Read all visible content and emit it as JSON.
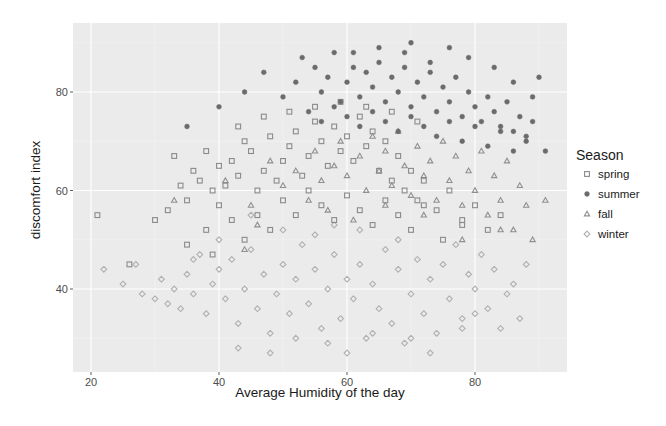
{
  "chart_data": {
    "type": "scatter",
    "title": "",
    "xlabel": "Average Humidity of the day",
    "ylabel": "discomfort index",
    "xlim": [
      17,
      94
    ],
    "ylim": [
      24,
      95
    ],
    "x_ticks": [
      20,
      40,
      60,
      80
    ],
    "y_ticks": [
      40,
      60,
      80
    ],
    "grid": true,
    "legend": {
      "title": "Season",
      "position": "right",
      "entries": [
        "spring",
        "summer",
        "fall",
        "winter"
      ]
    },
    "series": [
      {
        "name": "spring",
        "shape": "square-open",
        "color": "#8a8a8a",
        "points": [
          [
            21,
            55
          ],
          [
            26,
            45
          ],
          [
            30,
            54
          ],
          [
            32,
            56
          ],
          [
            33,
            67
          ],
          [
            34,
            61
          ],
          [
            35,
            58
          ],
          [
            36,
            64
          ],
          [
            37,
            62
          ],
          [
            38,
            68
          ],
          [
            39,
            60
          ],
          [
            40,
            65
          ],
          [
            41,
            61
          ],
          [
            42,
            66
          ],
          [
            43,
            63
          ],
          [
            44,
            70
          ],
          [
            45,
            68
          ],
          [
            46,
            60
          ],
          [
            47,
            64
          ],
          [
            48,
            71
          ],
          [
            49,
            62
          ],
          [
            50,
            66
          ],
          [
            51,
            69
          ],
          [
            52,
            72
          ],
          [
            53,
            63
          ],
          [
            54,
            67
          ],
          [
            55,
            74
          ],
          [
            56,
            70
          ],
          [
            57,
            65
          ],
          [
            58,
            73
          ],
          [
            59,
            68
          ],
          [
            60,
            71
          ],
          [
            61,
            66
          ],
          [
            62,
            75
          ],
          [
            63,
            69
          ],
          [
            64,
            72
          ],
          [
            65,
            64
          ],
          [
            66,
            70
          ],
          [
            67,
            62
          ],
          [
            68,
            67
          ],
          [
            69,
            60
          ],
          [
            70,
            64
          ],
          [
            71,
            58
          ],
          [
            72,
            62
          ],
          [
            74,
            56
          ],
          [
            76,
            60
          ],
          [
            78,
            53
          ],
          [
            80,
            57
          ],
          [
            82,
            52
          ],
          [
            84,
            55
          ],
          [
            38,
            52
          ],
          [
            40,
            57
          ],
          [
            42,
            54
          ],
          [
            44,
            50
          ],
          [
            46,
            55
          ],
          [
            48,
            52
          ],
          [
            50,
            58
          ],
          [
            52,
            55
          ],
          [
            54,
            60
          ],
          [
            56,
            57
          ],
          [
            58,
            54
          ],
          [
            60,
            59
          ],
          [
            62,
            56
          ],
          [
            64,
            53
          ],
          [
            66,
            58
          ],
          [
            68,
            55
          ],
          [
            70,
            52
          ],
          [
            72,
            57
          ],
          [
            75,
            50
          ],
          [
            78,
            54
          ],
          [
            43,
            73
          ],
          [
            47,
            75
          ],
          [
            51,
            76
          ],
          [
            55,
            77
          ],
          [
            59,
            78
          ],
          [
            63,
            77
          ],
          [
            67,
            76
          ],
          [
            71,
            74
          ],
          [
            35,
            49
          ],
          [
            39,
            47
          ]
        ]
      },
      {
        "name": "summer",
        "shape": "circle-filled",
        "color": "#6b6b6b",
        "points": [
          [
            35,
            73
          ],
          [
            40,
            77
          ],
          [
            44,
            80
          ],
          [
            47,
            84
          ],
          [
            50,
            79
          ],
          [
            52,
            82
          ],
          [
            53,
            87
          ],
          [
            55,
            85
          ],
          [
            56,
            80
          ],
          [
            57,
            83
          ],
          [
            58,
            88
          ],
          [
            59,
            78
          ],
          [
            60,
            82
          ],
          [
            61,
            85
          ],
          [
            62,
            79
          ],
          [
            63,
            84
          ],
          [
            64,
            81
          ],
          [
            65,
            86
          ],
          [
            66,
            78
          ],
          [
            67,
            83
          ],
          [
            68,
            80
          ],
          [
            69,
            85
          ],
          [
            70,
            77
          ],
          [
            71,
            82
          ],
          [
            72,
            79
          ],
          [
            73,
            84
          ],
          [
            74,
            76
          ],
          [
            75,
            81
          ],
          [
            76,
            78
          ],
          [
            77,
            83
          ],
          [
            78,
            75
          ],
          [
            79,
            80
          ],
          [
            80,
            77
          ],
          [
            81,
            74
          ],
          [
            82,
            79
          ],
          [
            83,
            76
          ],
          [
            84,
            73
          ],
          [
            85,
            78
          ],
          [
            86,
            72
          ],
          [
            87,
            75
          ],
          [
            88,
            70
          ],
          [
            89,
            74
          ],
          [
            90,
            83
          ],
          [
            91,
            68
          ],
          [
            54,
            76
          ],
          [
            56,
            74
          ],
          [
            58,
            77
          ],
          [
            60,
            75
          ],
          [
            62,
            73
          ],
          [
            64,
            76
          ],
          [
            66,
            74
          ],
          [
            68,
            72
          ],
          [
            70,
            75
          ],
          [
            72,
            73
          ],
          [
            74,
            71
          ],
          [
            76,
            74
          ],
          [
            78,
            70
          ],
          [
            80,
            73
          ],
          [
            82,
            69
          ],
          [
            84,
            72
          ],
          [
            86,
            68
          ],
          [
            88,
            71
          ],
          [
            70,
            90
          ],
          [
            76,
            89
          ],
          [
            79,
            87
          ],
          [
            61,
            88
          ],
          [
            65,
            89
          ],
          [
            73,
            86
          ],
          [
            69,
            88
          ],
          [
            83,
            85
          ],
          [
            86,
            82
          ],
          [
            89,
            79
          ]
        ]
      },
      {
        "name": "fall",
        "shape": "triangle-open",
        "color": "#909090",
        "points": [
          [
            33,
            58
          ],
          [
            41,
            62
          ],
          [
            45,
            57
          ],
          [
            48,
            66
          ],
          [
            50,
            61
          ],
          [
            52,
            64
          ],
          [
            54,
            58
          ],
          [
            55,
            68
          ],
          [
            56,
            62
          ],
          [
            58,
            65
          ],
          [
            59,
            70
          ],
          [
            60,
            63
          ],
          [
            62,
            67
          ],
          [
            63,
            60
          ],
          [
            64,
            71
          ],
          [
            65,
            64
          ],
          [
            66,
            68
          ],
          [
            67,
            61
          ],
          [
            68,
            72
          ],
          [
            69,
            65
          ],
          [
            70,
            59
          ],
          [
            71,
            69
          ],
          [
            72,
            63
          ],
          [
            73,
            66
          ],
          [
            74,
            58
          ],
          [
            75,
            70
          ],
          [
            76,
            62
          ],
          [
            77,
            67
          ],
          [
            78,
            57
          ],
          [
            79,
            64
          ],
          [
            80,
            60
          ],
          [
            81,
            68
          ],
          [
            82,
            55
          ],
          [
            83,
            63
          ],
          [
            84,
            58
          ],
          [
            85,
            66
          ],
          [
            86,
            52
          ],
          [
            87,
            61
          ],
          [
            88,
            57
          ],
          [
            89,
            50
          ],
          [
            91,
            58
          ],
          [
            46,
            53
          ],
          [
            44,
            48
          ],
          [
            57,
            56
          ],
          [
            61,
            54
          ],
          [
            66,
            57
          ],
          [
            72,
            55
          ],
          [
            78,
            50
          ],
          [
            84,
            52
          ]
        ]
      },
      {
        "name": "winter",
        "shape": "diamond-open",
        "color": "#b0b0b0",
        "points": [
          [
            22,
            44
          ],
          [
            25,
            41
          ],
          [
            27,
            45
          ],
          [
            28,
            39
          ],
          [
            30,
            38
          ],
          [
            31,
            42
          ],
          [
            32,
            37
          ],
          [
            33,
            40
          ],
          [
            34,
            36
          ],
          [
            35,
            43
          ],
          [
            36,
            39
          ],
          [
            37,
            47
          ],
          [
            38,
            35
          ],
          [
            39,
            41
          ],
          [
            40,
            44
          ],
          [
            41,
            38
          ],
          [
            42,
            46
          ],
          [
            43,
            33
          ],
          [
            44,
            40
          ],
          [
            45,
            48
          ],
          [
            46,
            36
          ],
          [
            47,
            43
          ],
          [
            48,
            31
          ],
          [
            49,
            39
          ],
          [
            50,
            45
          ],
          [
            51,
            35
          ],
          [
            52,
            42
          ],
          [
            53,
            49
          ],
          [
            54,
            37
          ],
          [
            55,
            44
          ],
          [
            56,
            32
          ],
          [
            57,
            40
          ],
          [
            58,
            47
          ],
          [
            59,
            34
          ],
          [
            60,
            42
          ],
          [
            61,
            38
          ],
          [
            62,
            45
          ],
          [
            63,
            30
          ],
          [
            64,
            41
          ],
          [
            65,
            36
          ],
          [
            66,
            48
          ],
          [
            67,
            33
          ],
          [
            68,
            44
          ],
          [
            69,
            29
          ],
          [
            70,
            39
          ],
          [
            71,
            46
          ],
          [
            72,
            35
          ],
          [
            73,
            42
          ],
          [
            74,
            31
          ],
          [
            75,
            45
          ],
          [
            76,
            38
          ],
          [
            77,
            49
          ],
          [
            78,
            34
          ],
          [
            79,
            43
          ],
          [
            80,
            40
          ],
          [
            81,
            47
          ],
          [
            82,
            36
          ],
          [
            83,
            44
          ],
          [
            84,
            32
          ],
          [
            86,
            41
          ],
          [
            88,
            45
          ],
          [
            43,
            28
          ],
          [
            48,
            27
          ],
          [
            52,
            30
          ],
          [
            57,
            29
          ],
          [
            60,
            27
          ],
          [
            64,
            31
          ],
          [
            70,
            30
          ],
          [
            73,
            27
          ],
          [
            78,
            32
          ],
          [
            80,
            35
          ],
          [
            85,
            39
          ],
          [
            87,
            34
          ],
          [
            50,
            52
          ],
          [
            55,
            51
          ],
          [
            45,
            55
          ],
          [
            62,
            52
          ],
          [
            68,
            50
          ],
          [
            58,
            53
          ],
          [
            40,
            50
          ],
          [
            36,
            46
          ]
        ]
      }
    ]
  }
}
